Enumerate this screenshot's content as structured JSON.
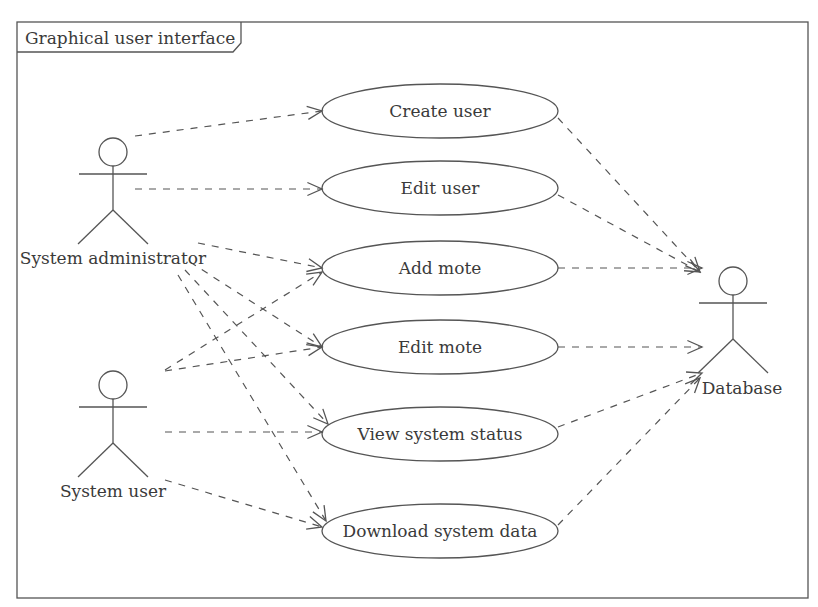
{
  "frame": {
    "title": "Graphical user interface",
    "x": 17,
    "y": 22,
    "width": 791,
    "height": 576
  },
  "actors": [
    {
      "id": "admin",
      "label": "System administrator",
      "cx": 113,
      "headY": 152,
      "labelX": 113,
      "labelY": 264
    },
    {
      "id": "user",
      "label": "System user",
      "cx": 113,
      "headY": 385,
      "labelX": 113,
      "labelY": 497
    },
    {
      "id": "db",
      "label": "Database",
      "cx": 733,
      "headY": 281,
      "labelX": 742,
      "labelY": 394
    }
  ],
  "use_cases": [
    {
      "id": "create_user",
      "label": "Create user",
      "cx": 440,
      "cy": 111,
      "rx": 118,
      "ry": 27
    },
    {
      "id": "edit_user",
      "label": "Edit user",
      "cx": 440,
      "cy": 188,
      "rx": 118,
      "ry": 27
    },
    {
      "id": "add_mote",
      "label": "Add mote",
      "cx": 440,
      "cy": 268,
      "rx": 118,
      "ry": 27
    },
    {
      "id": "edit_mote",
      "label": "Edit mote",
      "cx": 440,
      "cy": 347,
      "rx": 118,
      "ry": 27
    },
    {
      "id": "view_status",
      "label": "View system status",
      "cx": 440,
      "cy": 434,
      "rx": 118,
      "ry": 27
    },
    {
      "id": "download_data",
      "label": "Download system data",
      "cx": 440,
      "cy": 531,
      "rx": 118,
      "ry": 27
    }
  ],
  "associations": [
    {
      "from": "admin",
      "to": "create_user",
      "x1": 135,
      "y1": 136,
      "x2": 322,
      "y2": 111
    },
    {
      "from": "admin",
      "to": "edit_user",
      "x1": 135,
      "y1": 189,
      "x2": 322,
      "y2": 189
    },
    {
      "from": "admin",
      "to": "add_mote",
      "x1": 198,
      "y1": 243,
      "x2": 322,
      "y2": 268
    },
    {
      "from": "admin",
      "to": "edit_mote",
      "x1": 190,
      "y1": 262,
      "x2": 322,
      "y2": 347
    },
    {
      "from": "admin",
      "to": "view_status",
      "x1": 185,
      "y1": 270,
      "x2": 328,
      "y2": 424
    },
    {
      "from": "admin",
      "to": "download_data",
      "x1": 178,
      "y1": 275,
      "x2": 326,
      "y2": 521
    },
    {
      "from": "user",
      "to": "add_mote",
      "x1": 165,
      "y1": 370,
      "x2": 322,
      "y2": 272
    },
    {
      "from": "user",
      "to": "edit_mote",
      "x1": 165,
      "y1": 371,
      "x2": 322,
      "y2": 347
    },
    {
      "from": "user",
      "to": "view_status",
      "x1": 165,
      "y1": 432,
      "x2": 322,
      "y2": 432
    },
    {
      "from": "user",
      "to": "download_data",
      "x1": 165,
      "y1": 480,
      "x2": 322,
      "y2": 527
    },
    {
      "from": "create_user",
      "to": "db",
      "x1": 558,
      "y1": 118,
      "x2": 700,
      "y2": 272
    },
    {
      "from": "edit_user",
      "to": "db",
      "x1": 558,
      "y1": 195,
      "x2": 700,
      "y2": 272
    },
    {
      "from": "add_mote",
      "to": "db",
      "x1": 558,
      "y1": 268,
      "x2": 702,
      "y2": 268
    },
    {
      "from": "edit_mote",
      "to": "db",
      "x1": 558,
      "y1": 347,
      "x2": 702,
      "y2": 347
    },
    {
      "from": "view_status",
      "to": "db",
      "x1": 558,
      "y1": 427,
      "x2": 702,
      "y2": 373
    },
    {
      "from": "download_data",
      "to": "db",
      "x1": 558,
      "y1": 525,
      "x2": 700,
      "y2": 378
    }
  ],
  "colors": {
    "line": "#555555",
    "text": "#3a3a3a",
    "background": "#ffffff"
  }
}
